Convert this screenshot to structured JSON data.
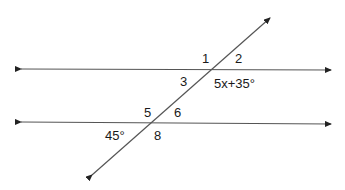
{
  "diagram": {
    "line_color": "#333333",
    "angle_labels": {
      "a1": "1",
      "a2": "2",
      "a3": "3",
      "a4_expr": "5x+35°",
      "a5": "5",
      "a6": "6",
      "a7_value": "45°",
      "a8": "8"
    },
    "lines": {
      "upper_parallel": {
        "x1": 16,
        "y1": 69,
        "x2": 335,
        "y2": 70
      },
      "lower_parallel": {
        "x1": 16,
        "y1": 122,
        "x2": 335,
        "y2": 124
      },
      "transversal": {
        "x1": 89,
        "y1": 178,
        "x2": 273,
        "y2": 15
      }
    }
  }
}
